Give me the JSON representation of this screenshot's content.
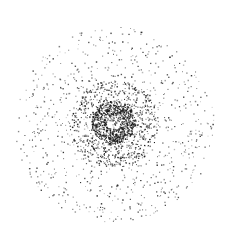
{
  "chart_data": {
    "type": "scatter",
    "title": "",
    "xlabel": "",
    "ylabel": "",
    "grid": false,
    "legend": null,
    "center": [
      114,
      124
    ],
    "outer_radius": 100,
    "dense_ring": {
      "center": [
        113,
        122
      ],
      "inner_radius": 7,
      "outer_radius": 22
    },
    "dot_color": "#1a1a1a",
    "background": "#ffffff",
    "layers": [
      {
        "name": "outer-field",
        "count": 900,
        "r_min": 0,
        "r_max": 100,
        "alpha_range": [
          0.25,
          0.9
        ]
      },
      {
        "name": "mid-halo",
        "count": 700,
        "r_min": 0,
        "r_max": 45,
        "alpha_range": [
          0.5,
          1.0
        ]
      },
      {
        "name": "dense-ring",
        "count": 650,
        "r_min": 7,
        "r_max": 22,
        "alpha_range": [
          0.7,
          1.0
        ]
      }
    ]
  }
}
